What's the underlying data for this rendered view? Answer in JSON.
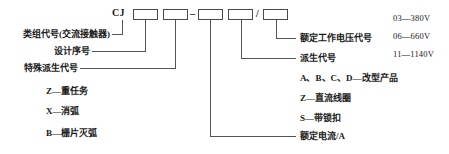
{
  "diagram": {
    "model_code": {
      "prefix": "CJ",
      "separator_dash": "–",
      "separator_slash": "/",
      "boxes": [
        "",
        "",
        "",
        "",
        ""
      ]
    },
    "left_labels": [
      {
        "text": "类组代号(交流接触器)"
      },
      {
        "text": "设计序号"
      },
      {
        "text": "特殊派生代号"
      },
      {
        "text": "Z—重任务"
      },
      {
        "text": "X—消弧"
      },
      {
        "text": "B—栅片灭弧"
      }
    ],
    "right_labels": [
      {
        "text": "额定工作电压代号"
      },
      {
        "text": "派生代号"
      },
      {
        "text": "A、B、C、D—改型产品"
      },
      {
        "text": "Z—直流线圈"
      },
      {
        "text": "S—带锁扣"
      },
      {
        "text": "额定电流/A"
      }
    ],
    "voltage_codes": [
      {
        "text": "03—380V"
      },
      {
        "text": "06—660V"
      },
      {
        "text": "11—1140V"
      }
    ],
    "colors": {
      "line": "#555555",
      "text": "#1a1a1a",
      "background": "#ffffff"
    }
  }
}
